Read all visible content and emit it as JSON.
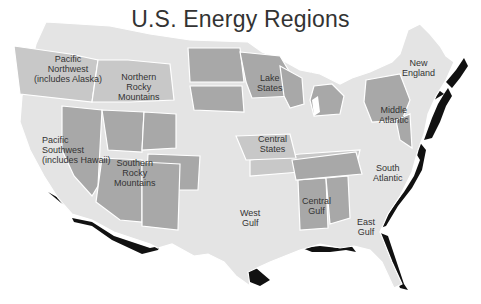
{
  "title": "U.S. Energy Regions",
  "colors": {
    "light": "#e4e4e4",
    "medium": "#c8c8c8",
    "dark": "#a8a8a8",
    "shadow": "#111111",
    "border": "#ffffff"
  },
  "regions": [
    {
      "name": "Pacific Northwest",
      "lines": [
        "Pacific",
        "Northwest",
        "(includes Alaska)"
      ],
      "shade": "light"
    },
    {
      "name": "Northern Rocky Mountains",
      "lines": [
        "Northern",
        "Rocky",
        "Mountains"
      ],
      "shade": "light"
    },
    {
      "name": "Pacific Southwest",
      "lines": [
        "Pacific",
        "Southwest",
        "(includes Hawaii)"
      ],
      "shade": "light"
    },
    {
      "name": "Southern Rocky Mountains",
      "lines": [
        "Southern",
        "Rocky",
        "Mountains"
      ],
      "shade": "dark"
    },
    {
      "name": "Lake States",
      "lines": [
        "Lake",
        "States"
      ],
      "shade": "dark"
    },
    {
      "name": "Central States",
      "lines": [
        "Central",
        "States"
      ],
      "shade": "light"
    },
    {
      "name": "New England",
      "lines": [
        "New",
        "England"
      ],
      "shade": "light"
    },
    {
      "name": "Middle Atlantic",
      "lines": [
        "Middle",
        "Atlantic"
      ],
      "shade": "dark"
    },
    {
      "name": "South Atlantic",
      "lines": [
        "South",
        "Atlantic"
      ],
      "shade": "light"
    },
    {
      "name": "West Gulf",
      "lines": [
        "West",
        "Gulf"
      ],
      "shade": "light"
    },
    {
      "name": "Central Gulf",
      "lines": [
        "Central",
        "Gulf"
      ],
      "shade": "dark"
    },
    {
      "name": "East Gulf",
      "lines": [
        "East",
        "Gulf"
      ],
      "shade": "light"
    }
  ]
}
